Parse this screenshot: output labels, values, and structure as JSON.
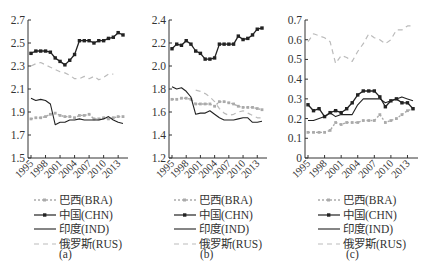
{
  "chart_data": [
    {
      "type": "line",
      "panel_label": "(a)",
      "title": "",
      "xlabel": "",
      "ylabel": "",
      "x": [
        1995,
        1996,
        1997,
        1998,
        1999,
        2000,
        2001,
        2002,
        2003,
        2004,
        2005,
        2006,
        2007,
        2008,
        2009,
        2010,
        2011,
        2012,
        2013,
        2014
      ],
      "xticks": [
        "1995",
        "1998",
        "2001",
        "2004",
        "2007",
        "2010",
        "2013"
      ],
      "yticks": [
        "1.5",
        "1.7",
        "1.9",
        "2.1",
        "2.3",
        "2.5",
        "2.7"
      ],
      "ylim": [
        1.5,
        2.7
      ],
      "grid": false,
      "legend_position": "bottom",
      "series": [
        {
          "name": "巴西(BRA)",
          "key": "BRA",
          "style": "dotted-marker",
          "color": "#aaaaaa",
          "values": [
            1.84,
            1.85,
            1.85,
            1.86,
            1.88,
            1.89,
            1.87,
            1.86,
            1.86,
            1.85,
            1.87,
            1.87,
            1.88,
            1.84,
            1.84,
            1.85,
            1.84,
            1.85,
            1.86,
            1.86
          ]
        },
        {
          "name": "中国(CHN)",
          "key": "CHN",
          "style": "solid-marker",
          "color": "#222222",
          "values": [
            2.41,
            2.43,
            2.43,
            2.43,
            2.42,
            2.37,
            2.34,
            2.31,
            2.35,
            2.4,
            2.52,
            2.52,
            2.52,
            2.5,
            2.52,
            2.52,
            2.54,
            2.55,
            2.59,
            2.57
          ]
        },
        {
          "name": "印度(IND)",
          "key": "IND",
          "style": "solid",
          "color": "#222222",
          "values": [
            2.02,
            2.0,
            2.01,
            2.0,
            1.97,
            1.79,
            1.81,
            1.81,
            1.83,
            1.83,
            1.84,
            1.83,
            1.83,
            1.83,
            1.83,
            1.84,
            1.86,
            1.83,
            1.81,
            1.8
          ]
        },
        {
          "name": "俄罗斯(RUS)",
          "key": "RUS",
          "style": "dashed",
          "color": "#bbbbbb",
          "values": [
            2.3,
            2.32,
            2.33,
            2.31,
            2.29,
            2.27,
            2.25,
            2.24,
            2.22,
            2.19,
            2.19,
            2.21,
            2.19,
            2.21,
            2.18,
            2.2,
            2.23,
            2.23,
            null,
            null
          ]
        }
      ]
    },
    {
      "type": "line",
      "panel_label": "(b)",
      "title": "",
      "xlabel": "",
      "ylabel": "",
      "x": [
        1995,
        1996,
        1997,
        1998,
        1999,
        2000,
        2001,
        2002,
        2003,
        2004,
        2005,
        2006,
        2007,
        2008,
        2009,
        2010,
        2011,
        2012,
        2013,
        2014
      ],
      "xticks": [
        "1995",
        "1998",
        "2001",
        "2004",
        "2007",
        "2010",
        "2013"
      ],
      "yticks": [
        "1.2",
        "1.4",
        "1.6",
        "1.8",
        "2.0",
        "2.2",
        "2.4"
      ],
      "ylim": [
        1.2,
        2.4
      ],
      "grid": false,
      "legend_position": "bottom",
      "series": [
        {
          "name": "巴西(BRA)",
          "key": "BRA",
          "style": "dotted-marker",
          "color": "#aaaaaa",
          "values": [
            1.71,
            1.71,
            1.72,
            1.72,
            1.71,
            1.67,
            1.67,
            1.67,
            1.67,
            1.65,
            1.69,
            1.69,
            1.68,
            1.67,
            1.65,
            1.64,
            1.64,
            1.64,
            1.63,
            1.62
          ]
        },
        {
          "name": "中国(CHN)",
          "key": "CHN",
          "style": "solid-marker",
          "color": "#222222",
          "values": [
            2.15,
            2.19,
            2.18,
            2.22,
            2.19,
            2.13,
            2.11,
            2.06,
            2.06,
            2.07,
            2.19,
            2.19,
            2.19,
            2.19,
            2.26,
            2.23,
            2.24,
            2.27,
            2.32,
            2.33
          ]
        },
        {
          "name": "印度(IND)",
          "key": "IND",
          "style": "solid",
          "color": "#222222",
          "values": [
            1.82,
            1.8,
            1.81,
            1.78,
            1.73,
            1.58,
            1.59,
            1.59,
            1.61,
            1.58,
            1.55,
            1.53,
            1.53,
            1.53,
            1.54,
            1.55,
            1.55,
            1.51,
            1.51,
            1.52
          ]
        },
        {
          "name": "俄罗斯(RUS)",
          "key": "RUS",
          "style": "dashed",
          "color": "#bbbbbb",
          "values": [
            null,
            null,
            null,
            null,
            null,
            1.79,
            1.78,
            1.76,
            1.73,
            1.69,
            1.63,
            1.59,
            1.57,
            1.58,
            1.6,
            1.61,
            1.59,
            1.57,
            1.55,
            1.55
          ]
        }
      ]
    },
    {
      "type": "line",
      "panel_label": "(c)",
      "title": "",
      "xlabel": "",
      "ylabel": "",
      "x": [
        1995,
        1996,
        1997,
        1998,
        1999,
        2000,
        2001,
        2002,
        2003,
        2004,
        2005,
        2006,
        2007,
        2008,
        2009,
        2010,
        2011,
        2012,
        2013,
        2014
      ],
      "xticks": [
        "1995",
        "1998",
        "2001",
        "2004",
        "2007",
        "2010",
        "2013"
      ],
      "yticks": [
        "0",
        "0.1",
        "0.2",
        "0.3",
        "0.4",
        "0.5",
        "0.6",
        "0.7"
      ],
      "ylim": [
        0,
        0.7
      ],
      "grid": false,
      "legend_position": "bottom",
      "series": [
        {
          "name": "巴西(BRA)",
          "key": "BRA",
          "style": "dotted-marker",
          "color": "#aaaaaa",
          "values": [
            0.13,
            0.13,
            0.13,
            0.13,
            0.14,
            0.18,
            0.17,
            0.18,
            0.18,
            0.18,
            0.19,
            0.19,
            0.19,
            0.22,
            0.18,
            0.19,
            0.2,
            0.22,
            0.24,
            0.25
          ]
        },
        {
          "name": "中国(CHN)",
          "key": "CHN",
          "style": "solid-marker",
          "color": "#222222",
          "values": [
            0.27,
            0.24,
            0.25,
            0.21,
            0.23,
            0.24,
            0.23,
            0.25,
            0.28,
            0.32,
            0.34,
            0.34,
            0.34,
            0.31,
            0.26,
            0.29,
            0.3,
            0.28,
            0.28,
            0.25
          ]
        },
        {
          "name": "印度(IND)",
          "key": "IND",
          "style": "solid",
          "color": "#222222",
          "values": [
            0.19,
            0.19,
            0.2,
            0.21,
            0.23,
            0.21,
            0.22,
            0.22,
            0.22,
            0.27,
            0.3,
            0.3,
            0.3,
            0.3,
            0.28,
            0.29,
            0.3,
            0.31,
            0.3,
            0.29
          ]
        },
        {
          "name": "俄罗斯(RUS)",
          "key": "RUS",
          "style": "dashed",
          "color": "#bbbbbb",
          "values": [
            0.59,
            0.63,
            0.62,
            0.61,
            0.59,
            0.48,
            0.52,
            0.51,
            0.49,
            0.54,
            0.58,
            0.63,
            0.61,
            0.6,
            0.58,
            0.6,
            0.65,
            0.65,
            0.67,
            0.67
          ]
        }
      ]
    }
  ],
  "legend": {
    "items": [
      {
        "label": "巴西(BRA)",
        "style": "dotted-marker"
      },
      {
        "label": "中国(CHN)",
        "style": "solid-marker"
      },
      {
        "label": "印度(IND)",
        "style": "solid"
      },
      {
        "label": "俄罗斯(RUS)",
        "style": "dashed"
      }
    ]
  },
  "captions": [
    "(a)",
    "(b)",
    "(c)"
  ]
}
